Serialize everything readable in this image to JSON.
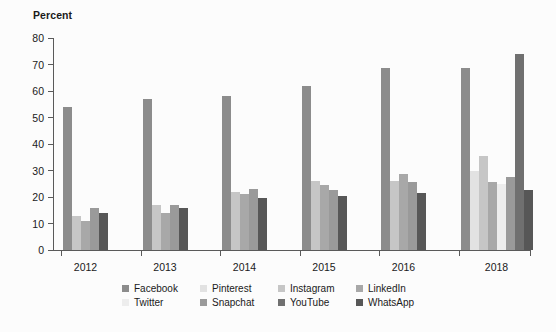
{
  "chart_data": {
    "type": "bar",
    "title": "",
    "subtitle": "",
    "xlabel": "",
    "ylabel": "Percent",
    "ylim": [
      0,
      80
    ],
    "yticks": [
      0,
      10,
      20,
      30,
      40,
      50,
      60,
      70,
      80
    ],
    "grid": false,
    "legend_position": "bottom",
    "categories": [
      "2012",
      "2013",
      "2014",
      "2015",
      "2016",
      "2018"
    ],
    "series": [
      {
        "name": "Facebook",
        "color": "#8c8c8c",
        "values": [
          54,
          57,
          58,
          62,
          68.5,
          68.5
        ]
      },
      {
        "name": "Pinterest",
        "color": "#e2e2e2",
        "values": [
          null,
          null,
          null,
          null,
          null,
          29.8
        ]
      },
      {
        "name": "Instagram",
        "color": "#c6c6c6",
        "values": [
          13,
          17,
          22,
          26,
          26,
          35.5
        ]
      },
      {
        "name": "LinkedIn",
        "color": "#a8a8a8",
        "values": [
          11,
          14,
          21,
          24.5,
          28.5,
          25.5
        ]
      },
      {
        "name": "Twitter",
        "color": "#ededed",
        "values": [
          null,
          null,
          null,
          null,
          null,
          25
        ]
      },
      {
        "name": "Snapchat",
        "color": "#9a9a9a",
        "values": [
          16,
          17,
          23,
          22.5,
          25.5,
          27.5
        ]
      },
      {
        "name": "YouTube",
        "color": "#707070",
        "values": [
          null,
          null,
          null,
          null,
          null,
          74
        ]
      },
      {
        "name": "WhatsApp",
        "color": "#575757",
        "values": [
          14,
          16,
          19.5,
          20.5,
          21.5,
          22.5
        ]
      }
    ],
    "group_series_order": {
      "2012": [
        "Facebook",
        "Instagram",
        "LinkedIn",
        "Snapchat",
        "WhatsApp"
      ],
      "2013": [
        "Facebook",
        "Instagram",
        "LinkedIn",
        "Snapchat",
        "WhatsApp"
      ],
      "2014": [
        "Facebook",
        "Instagram",
        "LinkedIn",
        "Snapchat",
        "WhatsApp"
      ],
      "2015": [
        "Facebook",
        "Instagram",
        "LinkedIn",
        "Snapchat",
        "WhatsApp"
      ],
      "2016": [
        "Facebook",
        "Instagram",
        "LinkedIn",
        "Snapchat",
        "WhatsApp"
      ],
      "2018": [
        "Facebook",
        "Pinterest",
        "Instagram",
        "LinkedIn",
        "Twitter",
        "Snapchat",
        "YouTube",
        "WhatsApp"
      ]
    }
  },
  "legend": {
    "row1": [
      {
        "label": "Facebook",
        "color": "#8c8c8c"
      },
      {
        "label": "Pinterest",
        "color": "#e2e2e2"
      },
      {
        "label": "Instagram",
        "color": "#c6c6c6"
      },
      {
        "label": "LinkedIn",
        "color": "#a8a8a8"
      }
    ],
    "row2": [
      {
        "label": "Twitter",
        "color": "#ededed"
      },
      {
        "label": "Snapchat",
        "color": "#9a9a9a"
      },
      {
        "label": "YouTube",
        "color": "#707070"
      },
      {
        "label": "WhatsApp",
        "color": "#575757"
      }
    ]
  }
}
